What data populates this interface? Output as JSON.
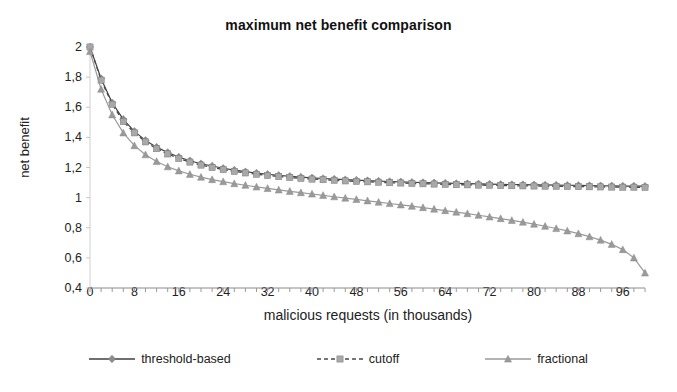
{
  "chart_data": {
    "type": "line",
    "title": "maximum net benefit comparison",
    "xlabel": "malicious requests (in thousands)",
    "ylabel": "net benefit",
    "xlim": [
      0,
      100
    ],
    "ylim": [
      0.4,
      2.0
    ],
    "grid": false,
    "legend_position": "bottom",
    "decimal_separator": ",",
    "xticks": [
      0,
      8,
      16,
      24,
      32,
      40,
      48,
      56,
      64,
      72,
      80,
      88,
      96
    ],
    "xtick_labels": [
      "0",
      "8",
      "16",
      "24",
      "32",
      "40",
      "48",
      "56",
      "64",
      "72",
      "80",
      "88",
      "96"
    ],
    "yticks": [
      0.4,
      0.6,
      0.8,
      1.0,
      1.2,
      1.4,
      1.6,
      1.8,
      2.0
    ],
    "ytick_labels": [
      "0,4",
      "0,6",
      "0,8",
      "1",
      "1,2",
      "1,4",
      "1,6",
      "1,8",
      "2"
    ],
    "x": [
      0,
      2,
      4,
      6,
      8,
      10,
      12,
      14,
      16,
      18,
      20,
      22,
      24,
      26,
      28,
      30,
      32,
      34,
      36,
      38,
      40,
      42,
      44,
      46,
      48,
      50,
      52,
      54,
      56,
      58,
      60,
      62,
      64,
      66,
      68,
      70,
      72,
      74,
      76,
      78,
      80,
      82,
      84,
      86,
      88,
      90,
      92,
      94,
      96,
      98,
      100
    ],
    "series": [
      {
        "name": "threshold-based",
        "color": "#3f3f3f",
        "marker": "diamond",
        "marker_color": "#8c8c8c",
        "dash": "solid",
        "values": [
          2.0,
          1.79,
          1.63,
          1.52,
          1.44,
          1.38,
          1.335,
          1.3,
          1.27,
          1.245,
          1.225,
          1.21,
          1.195,
          1.183,
          1.172,
          1.163,
          1.155,
          1.148,
          1.142,
          1.136,
          1.131,
          1.127,
          1.123,
          1.119,
          1.116,
          1.113,
          1.11,
          1.107,
          1.105,
          1.102,
          1.1,
          1.098,
          1.096,
          1.094,
          1.093,
          1.091,
          1.09,
          1.088,
          1.087,
          1.086,
          1.085,
          1.084,
          1.083,
          1.082,
          1.081,
          1.08,
          1.079,
          1.078,
          1.077,
          1.077,
          1.076
        ]
      },
      {
        "name": "cutoff",
        "color": "#4a4a4a",
        "marker": "square",
        "marker_color": "#a8a8a8",
        "dash": "dashed",
        "values": [
          2.0,
          1.78,
          1.62,
          1.505,
          1.43,
          1.37,
          1.325,
          1.29,
          1.26,
          1.236,
          1.216,
          1.2,
          1.186,
          1.174,
          1.164,
          1.155,
          1.147,
          1.14,
          1.134,
          1.128,
          1.123,
          1.119,
          1.115,
          1.111,
          1.108,
          1.105,
          1.102,
          1.099,
          1.097,
          1.094,
          1.092,
          1.09,
          1.088,
          1.086,
          1.085,
          1.083,
          1.082,
          1.08,
          1.079,
          1.078,
          1.077,
          1.076,
          1.075,
          1.074,
          1.073,
          1.072,
          1.071,
          1.07,
          1.069,
          1.069,
          1.068
        ]
      },
      {
        "name": "fractional",
        "color": "#9a9a9a",
        "marker": "triangle",
        "marker_color": "#9a9a9a",
        "dash": "solid",
        "values": [
          1.97,
          1.72,
          1.55,
          1.43,
          1.345,
          1.285,
          1.24,
          1.205,
          1.178,
          1.155,
          1.136,
          1.12,
          1.106,
          1.093,
          1.082,
          1.071,
          1.061,
          1.051,
          1.042,
          1.033,
          1.024,
          1.015,
          1.006,
          0.997,
          0.988,
          0.979,
          0.97,
          0.961,
          0.952,
          0.943,
          0.934,
          0.924,
          0.914,
          0.904,
          0.894,
          0.883,
          0.872,
          0.861,
          0.849,
          0.837,
          0.824,
          0.81,
          0.795,
          0.779,
          0.761,
          0.741,
          0.718,
          0.69,
          0.655,
          0.6,
          0.5
        ]
      }
    ]
  }
}
